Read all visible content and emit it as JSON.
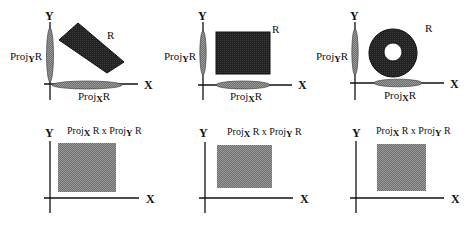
{
  "figure": {
    "colors": {
      "dark_fill": "#2a2a2a",
      "shadow_fill": "#7a7a7a",
      "product_fill": "#8a8a8a",
      "axis": "#111111"
    },
    "top_row": [
      {
        "shape": "rotated-rectangle",
        "region_label": "R",
        "y_axis_label": "Y",
        "x_axis_label": "X",
        "proj_y_label": {
          "base": "Proj",
          "sub": "Y",
          "tail": "R"
        },
        "proj_x_label": {
          "base": "Proj",
          "sub": "X",
          "tail": "R"
        }
      },
      {
        "shape": "rectangle",
        "region_label": "R",
        "y_axis_label": "Y",
        "x_axis_label": "X",
        "proj_y_label": {
          "base": "Proj",
          "sub": "Y",
          "tail": "R"
        },
        "proj_x_label": {
          "base": "Proj",
          "sub": "X",
          "tail": "R"
        }
      },
      {
        "shape": "annulus",
        "region_label": "R",
        "y_axis_label": "Y",
        "x_axis_label": "X",
        "proj_y_label": {
          "base": "Proj",
          "sub": "Y",
          "tail": "R"
        },
        "proj_x_label": {
          "base": "Proj",
          "sub": "X",
          "tail": "R"
        }
      }
    ],
    "bottom_row": [
      {
        "y_axis_label": "Y",
        "x_axis_label": "X",
        "product_label": {
          "p1": "Proj",
          "s1": "X",
          "mid": " R x Proj",
          "s2": "Y",
          "tail": " R"
        }
      },
      {
        "y_axis_label": "Y",
        "x_axis_label": "X",
        "product_label": {
          "p1": "Proj",
          "s1": "X",
          "mid": " R x Proj",
          "s2": "Y",
          "tail": " R"
        }
      },
      {
        "y_axis_label": "Y",
        "x_axis_label": "X",
        "product_label": {
          "p1": "Proj",
          "s1": "X",
          "mid": " R x Proj",
          "s2": "Y",
          "tail": " R"
        }
      }
    ]
  }
}
